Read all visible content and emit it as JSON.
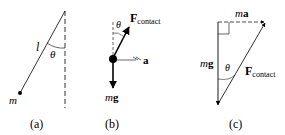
{
  "panels": [
    {
      "id": "a",
      "caption": "(a)",
      "labels": {
        "length": "l",
        "angle": "θ",
        "mass": "m"
      }
    },
    {
      "id": "b",
      "caption": "(b)",
      "labels": {
        "force_main": "F",
        "force_sub": "contact",
        "angle": "θ",
        "accel": "a",
        "weight_m": "m",
        "weight_g": "g"
      }
    },
    {
      "id": "c",
      "caption": "(c)",
      "labels": {
        "ma_m": "m",
        "ma_a": "a",
        "weight_m": "m",
        "weight_g": "g",
        "angle": "θ",
        "force_main": "F",
        "force_sub": "contact"
      }
    }
  ],
  "colors": {
    "ink": "#000000",
    "background": "#ffffff"
  }
}
